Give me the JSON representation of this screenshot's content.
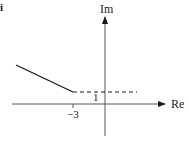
{
  "figure": {
    "part_label": "i",
    "axes": {
      "x_label": "Re",
      "y_label": "Im"
    },
    "tick_labels": {
      "real_tick": "−3",
      "imag_tick": "1"
    },
    "curves": [
      {
        "name": "solid-ray",
        "style": "solid",
        "description": "half-line from (-3, 1) extending up-left"
      },
      {
        "name": "dashed-line",
        "style": "dashed",
        "description": "horizontal boundary Im = 1 for Re > -3"
      }
    ],
    "colors": {
      "ink": "#1a1a1a",
      "axis": "#555555",
      "background": "#ffffff"
    }
  }
}
